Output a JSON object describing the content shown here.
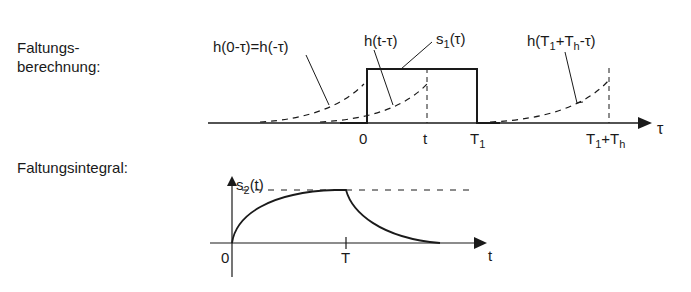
{
  "sections": {
    "convolution_calc": {
      "line1": "Faltungs-",
      "line2": "berechnung:"
    },
    "convolution_integral": {
      "label": "Faltungsintegral:"
    }
  },
  "top_plot": {
    "annotations": {
      "h_zero": "h(0-τ)=h(-τ)",
      "h_t_main": "h(t-τ)",
      "s1_main": "s",
      "s1_sub": "1",
      "s1_arg": "(τ)",
      "hT_prefix": "h(T",
      "hT_sub1": "1",
      "hT_mid": "+T",
      "hT_sub2": "h",
      "hT_suffix": "-τ)"
    },
    "ticks": {
      "zero": "0",
      "t": "t",
      "T1_main": "T",
      "T1_sub": "1",
      "T1Th_a": "T",
      "T1Th_sub1": "1",
      "T1Th_plus": "+T",
      "T1Th_sub2": "h"
    },
    "axis_label": "τ"
  },
  "bottom_plot": {
    "y_label_main": "s",
    "y_label_sub": "2",
    "y_label_arg": "(t)",
    "ticks": {
      "zero": "0",
      "T": "T"
    },
    "axis_label": "t"
  },
  "colors": {
    "ink": "#1a1a1a",
    "background": "#ffffff"
  }
}
